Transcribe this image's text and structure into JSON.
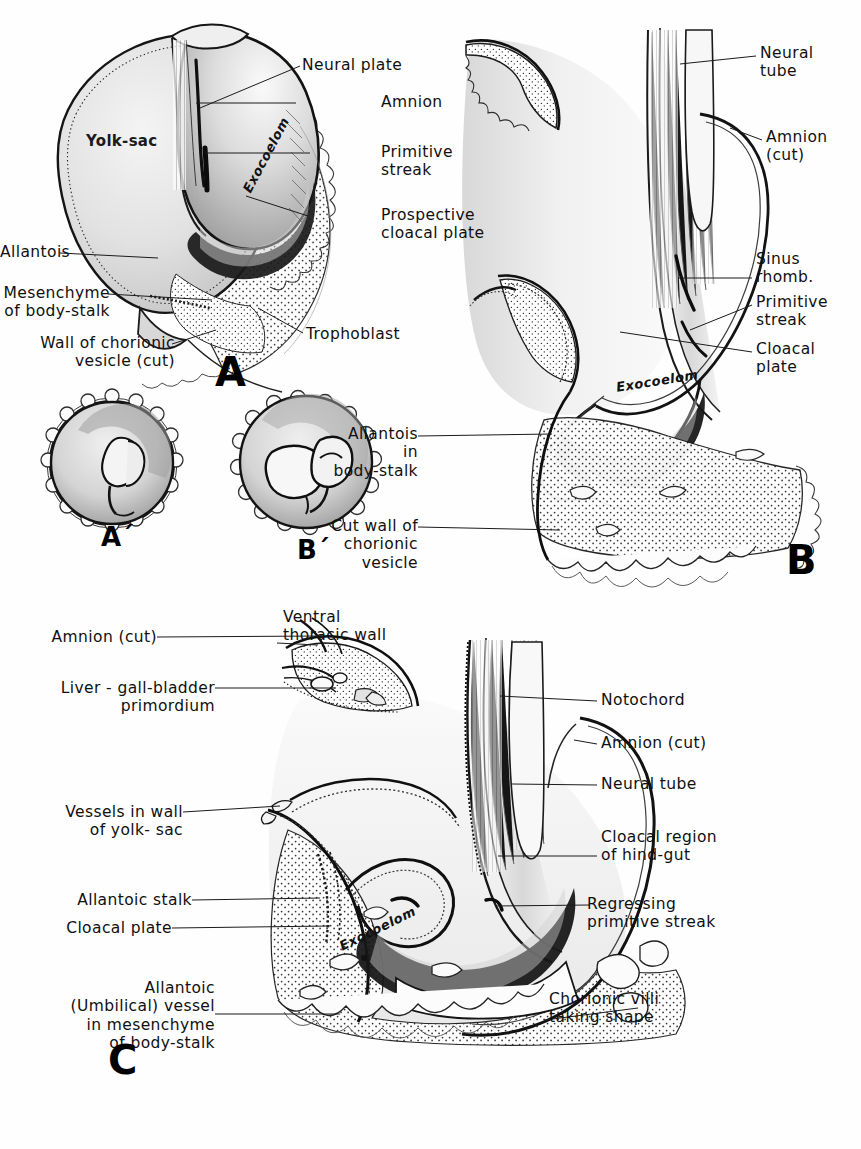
{
  "figure": {
    "panels": [
      {
        "id": "A",
        "letter": "A",
        "labels": [
          {
            "text": "Neural plate",
            "name": "label-neural-plate"
          },
          {
            "text": "Amnion",
            "name": "label-amnion"
          },
          {
            "text": "Primitive\nstreak",
            "name": "label-primitive-streak"
          },
          {
            "text": "Prospective\ncloacal plate",
            "name": "label-prospective-cloacal-plate"
          },
          {
            "text": "Allantois",
            "name": "label-allantois"
          },
          {
            "text": "Mesenchyme\nof body-stalk",
            "name": "label-mesenchyme-of-body-stalk"
          },
          {
            "text": "Wall of  chorionic\nvesicle (cut)",
            "name": "label-wall-of-chorionic-vesicle"
          },
          {
            "text": "Trophoblast",
            "name": "label-trophoblast"
          }
        ],
        "in_figure": [
          {
            "text": "Yolk-sac",
            "name": "label-yolk-sac"
          },
          {
            "text": "Exocoelom",
            "name": "label-exocoelom"
          }
        ]
      },
      {
        "id": "A-prime",
        "letter": "A´",
        "labels": [],
        "in_figure": []
      },
      {
        "id": "B-prime",
        "letter": "B´",
        "labels": [],
        "in_figure": []
      },
      {
        "id": "B",
        "letter": "B",
        "labels": [
          {
            "text": "Neural\ntube",
            "name": "label-neural-tube"
          },
          {
            "text": "Amnion\n(cut)",
            "name": "label-amnion-cut"
          },
          {
            "text": "Sinus\nrhomb.",
            "name": "label-sinus-rhomb"
          },
          {
            "text": "Primitive\nstreak",
            "name": "label-primitive-streak"
          },
          {
            "text": "Cloacal\nplate",
            "name": "label-cloacal-plate"
          },
          {
            "text": "Allantois\nin\nbody-stalk",
            "name": "label-allantois-in-body-stalk"
          },
          {
            "text": "Cut wall of\nchorionic\nvesicle",
            "name": "label-cut-wall-of-chorionic-vesicle"
          }
        ],
        "in_figure": [
          {
            "text": "Exocoelom",
            "name": "label-exocoelom"
          }
        ]
      },
      {
        "id": "C",
        "letter": "C",
        "labels": [
          {
            "text": "Amnion (cut)",
            "name": "label-amnion-cut-left"
          },
          {
            "text": "Ventral\nthoracic  wall",
            "name": "label-ventral-thoracic-wall"
          },
          {
            "text": "Liver - gall-bladder\nprimordium",
            "name": "label-liver-gall-bladder-primordium"
          },
          {
            "text": "Vessels in wall\nof  yolk- sac",
            "name": "label-vessels-in-wall-of-yolk-sac"
          },
          {
            "text": "Allantoic  stalk",
            "name": "label-allantoic-stalk"
          },
          {
            "text": "Cloacal  plate",
            "name": "label-cloacal-plate"
          },
          {
            "text": "Allantoic\n(Umbilical) vessel\nin mesenchyme\nof  body-stalk",
            "name": "label-allantoic-umbilical-vessel"
          },
          {
            "text": "Notochord",
            "name": "label-notochord"
          },
          {
            "text": "Amnion (cut)",
            "name": "label-amnion-cut-right"
          },
          {
            "text": "Neural  tube",
            "name": "label-neural-tube"
          },
          {
            "text": "Cloacal  region\nof hind-gut",
            "name": "label-cloacal-region-of-hind-gut"
          },
          {
            "text": "Regressing\nprimitive streak",
            "name": "label-regressing-primitive-streak"
          },
          {
            "text": "Chorionic  villi\ntaking   shape",
            "name": "label-chorionic-villi-taking-shape"
          }
        ],
        "in_figure": [
          {
            "text": "Exocoelom",
            "name": "label-exocoelom"
          }
        ]
      }
    ],
    "colors": {
      "ink": "#1a1a1a",
      "paper": "#fefefe",
      "wash_light": "#e8e8e8",
      "wash_mid": "#cfcfcf",
      "wash_dark": "#9a9a9a"
    }
  }
}
